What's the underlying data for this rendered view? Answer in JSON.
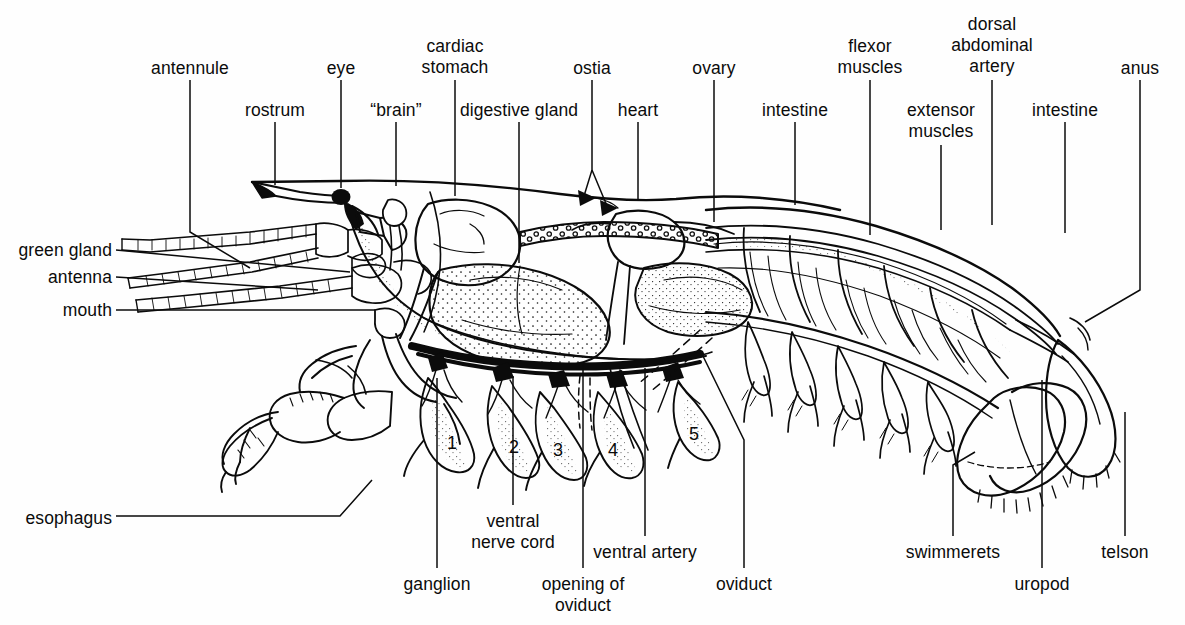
{
  "figure": {
    "background_color": "#fefefe",
    "ink_color": "#0b0b0b",
    "width": 1185,
    "height": 625
  },
  "labels": [
    {
      "id": "antennule",
      "text": "antennule",
      "x": 190,
      "y": 58,
      "align": "c",
      "leader": [
        [
          190,
          80
        ],
        [
          190,
          232
        ],
        [
          250,
          268
        ]
      ]
    },
    {
      "id": "rostrum",
      "text": "rostrum",
      "x": 275,
      "y": 100,
      "align": "c",
      "leader": [
        [
          275,
          122
        ],
        [
          275,
          185
        ]
      ]
    },
    {
      "id": "eye",
      "text": "eye",
      "x": 341,
      "y": 58,
      "align": "c",
      "leader": [
        [
          341,
          80
        ],
        [
          341,
          188
        ]
      ]
    },
    {
      "id": "brain",
      "text": "“brain”",
      "x": 396,
      "y": 100,
      "align": "c",
      "leader": [
        [
          396,
          122
        ],
        [
          396,
          186
        ]
      ]
    },
    {
      "id": "cardiac-stomach",
      "text": "cardiac\nstomach",
      "x": 455,
      "y": 36,
      "align": "c",
      "leader": [
        [
          455,
          80
        ],
        [
          455,
          196
        ]
      ]
    },
    {
      "id": "digestive-gland",
      "text": "digestive gland",
      "x": 519,
      "y": 100,
      "align": "c",
      "leader": [
        [
          519,
          122
        ],
        [
          519,
          263
        ]
      ]
    },
    {
      "id": "ostia",
      "text": "ostia",
      "x": 592,
      "y": 58,
      "align": "c",
      "leader": [
        [
          592,
          80
        ],
        [
          592,
          170
        ],
        [
          584,
          196
        ]
      ],
      "leader2": [
        [
          592,
          170
        ],
        [
          607,
          206
        ]
      ]
    },
    {
      "id": "heart",
      "text": "heart",
      "x": 638,
      "y": 100,
      "align": "c",
      "leader": [
        [
          638,
          122
        ],
        [
          638,
          200
        ]
      ]
    },
    {
      "id": "ovary",
      "text": "ovary",
      "x": 714,
      "y": 58,
      "align": "c",
      "leader": [
        [
          714,
          80
        ],
        [
          714,
          222
        ]
      ]
    },
    {
      "id": "intestine-anterior",
      "text": "intestine",
      "x": 795,
      "y": 100,
      "align": "c",
      "leader": [
        [
          795,
          122
        ],
        [
          795,
          205
        ]
      ]
    },
    {
      "id": "flexor-muscles",
      "text": "flexor\nmuscles",
      "x": 870,
      "y": 36,
      "align": "c",
      "leader": [
        [
          870,
          80
        ],
        [
          870,
          235
        ]
      ]
    },
    {
      "id": "extensor-muscles",
      "text": "extensor\nmuscles",
      "x": 941,
      "y": 100,
      "align": "c",
      "leader": [
        [
          941,
          145
        ],
        [
          941,
          230
        ]
      ]
    },
    {
      "id": "dorsal-abdominal-artery",
      "text": "dorsal\nabdominal\nartery",
      "x": 992,
      "y": 14,
      "align": "c",
      "leader": [
        [
          992,
          80
        ],
        [
          992,
          225
        ]
      ]
    },
    {
      "id": "intestine-posterior",
      "text": "intestine",
      "x": 1065,
      "y": 100,
      "align": "c",
      "leader": [
        [
          1065,
          122
        ],
        [
          1065,
          233
        ]
      ]
    },
    {
      "id": "anus",
      "text": "anus",
      "x": 1140,
      "y": 58,
      "align": "c",
      "leader": [
        [
          1140,
          80
        ],
        [
          1140,
          290
        ],
        [
          1085,
          322
        ]
      ]
    },
    {
      "id": "green-gland",
      "text": "green gland",
      "x": 112,
      "y": 240,
      "align": "r",
      "leader": [
        [
          116,
          250
        ],
        [
          350,
          272
        ]
      ]
    },
    {
      "id": "antenna",
      "text": "antenna",
      "x": 112,
      "y": 267,
      "align": "r",
      "leader": [
        [
          116,
          277
        ],
        [
          318,
          290
        ]
      ]
    },
    {
      "id": "mouth",
      "text": "mouth",
      "x": 112,
      "y": 300,
      "align": "r",
      "leader": [
        [
          116,
          310
        ],
        [
          375,
          310
        ]
      ]
    },
    {
      "id": "esophagus",
      "text": "esophagus",
      "x": 112,
      "y": 508,
      "align": "r",
      "leader": [
        [
          116,
          516
        ],
        [
          340,
          516
        ],
        [
          372,
          480
        ]
      ]
    },
    {
      "id": "ganglion",
      "text": "ganglion",
      "x": 437,
      "y": 574,
      "align": "c",
      "leader": [
        [
          437,
          568
        ],
        [
          437,
          378
        ]
      ]
    },
    {
      "id": "ventral-nerve-cord",
      "text": "ventral\nnerve cord",
      "x": 513,
      "y": 511,
      "align": "c",
      "leader": [
        [
          513,
          505
        ],
        [
          513,
          376
        ]
      ]
    },
    {
      "id": "opening-of-oviduct",
      "text": "opening of\noviduct",
      "x": 583,
      "y": 574,
      "align": "c",
      "leader": [
        [
          583,
          568
        ],
        [
          583,
          364
        ]
      ]
    },
    {
      "id": "ventral-artery",
      "text": "ventral artery",
      "x": 645,
      "y": 542,
      "align": "c",
      "leader": [
        [
          645,
          536
        ],
        [
          645,
          368
        ]
      ]
    },
    {
      "id": "oviduct",
      "text": "oviduct",
      "x": 744,
      "y": 574,
      "align": "c",
      "leader": [
        [
          744,
          568
        ],
        [
          744,
          440
        ],
        [
          700,
          350
        ]
      ]
    },
    {
      "id": "swimmerets",
      "text": "swimmerets",
      "x": 953,
      "y": 542,
      "align": "c",
      "leader": [
        [
          953,
          536
        ],
        [
          953,
          465
        ],
        [
          975,
          452
        ]
      ]
    },
    {
      "id": "uropod",
      "text": "uropod",
      "x": 1042,
      "y": 574,
      "align": "c",
      "leader": [
        [
          1042,
          568
        ],
        [
          1042,
          380
        ]
      ]
    },
    {
      "id": "telson",
      "text": "telson",
      "x": 1125,
      "y": 542,
      "align": "c",
      "leader": [
        [
          1125,
          536
        ],
        [
          1125,
          412
        ]
      ]
    }
  ],
  "segment_numbers": [
    {
      "id": "leg-1",
      "text": "1",
      "x": 452,
      "y": 443
    },
    {
      "id": "leg-2",
      "text": "2",
      "x": 514,
      "y": 447
    },
    {
      "id": "leg-3",
      "text": "3",
      "x": 558,
      "y": 450
    },
    {
      "id": "leg-4",
      "text": "4",
      "x": 613,
      "y": 450
    },
    {
      "id": "leg-5",
      "text": "5",
      "x": 694,
      "y": 434
    }
  ]
}
